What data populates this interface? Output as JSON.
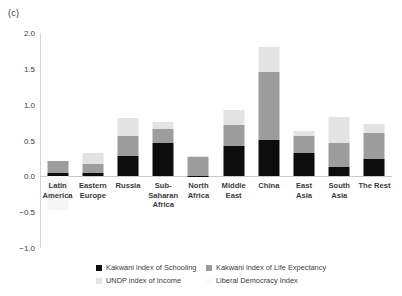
{
  "panel": {
    "label": "(c)"
  },
  "legend": {
    "items": [
      {
        "label": "Kakwani index of Schooling",
        "color": "#0d0d0d",
        "key": "s0"
      },
      {
        "label": "Kakwani index of Life Expectancy",
        "color": "#9d9d9d",
        "key": "s1"
      },
      {
        "label": "UNDP index of Income",
        "color": "#e3e3e3",
        "key": "s2"
      },
      {
        "label": "Liberal Democracy Index",
        "color": "#fbfbfb",
        "key": "s3"
      }
    ]
  },
  "chart_data": {
    "type": "bar",
    "title": "(c)",
    "xlabel": "",
    "ylabel": "",
    "ylim": [
      -1.0,
      2.0
    ],
    "yticks": [
      -1.0,
      -0.5,
      0.0,
      0.5,
      1.0,
      1.5,
      2.0
    ],
    "ytick_labels": [
      "−1.0",
      "−0.5",
      "0.0",
      "0.5",
      "1.0",
      "1.5",
      "2.0"
    ],
    "grid": false,
    "stacked": true,
    "legend_position": "bottom",
    "categories": [
      "Latin America",
      "Eastern Europe",
      "Russia",
      "Sub-Saharan Africa",
      "North Africa",
      "Middle East",
      "China",
      "East Asia",
      "South Asia",
      "The Rest"
    ],
    "series": [
      {
        "name": "Kakwani index of Schooling",
        "color": "#0d0d0d",
        "values": [
          0.04,
          0.05,
          0.29,
          0.46,
          0.01,
          0.43,
          0.51,
          0.33,
          0.13,
          0.24
        ]
      },
      {
        "name": "Kakwani index of Life Expectancy",
        "color": "#9d9d9d",
        "values": [
          0.17,
          0.12,
          0.27,
          0.2,
          0.26,
          0.29,
          0.94,
          0.23,
          0.33,
          0.36
        ]
      },
      {
        "name": "UNDP index of Income",
        "color": "#e3e3e3",
        "values": [
          0.01,
          0.16,
          0.25,
          0.1,
          0.01,
          0.2,
          0.35,
          0.07,
          0.37,
          0.13
        ]
      },
      {
        "name": "Liberal Democracy Index",
        "color": "#fbfbfb",
        "values": [
          -0.47,
          0.0,
          0.0,
          0.0,
          0.0,
          0.0,
          0.0,
          0.0,
          0.0,
          0.0
        ]
      }
    ],
    "totals_positive": [
      0.22,
      0.33,
      0.81,
      0.76,
      0.28,
      0.92,
      1.8,
      0.63,
      0.83,
      0.73
    ]
  }
}
